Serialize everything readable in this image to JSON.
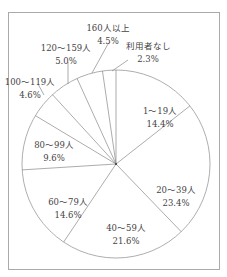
{
  "chart_data": {
    "type": "pie",
    "title": "",
    "start_angle_deg": 0,
    "direction": "clockwise",
    "slices": [
      {
        "label": "1〜19人",
        "value": 14.4,
        "pct": "14.4%"
      },
      {
        "label": "20〜39人",
        "value": 23.4,
        "pct": "23.4%"
      },
      {
        "label": "40〜59人",
        "value": 21.6,
        "pct": "21.6%"
      },
      {
        "label": "60〜79人",
        "value": 14.6,
        "pct": "14.6%"
      },
      {
        "label": "80〜99人",
        "value": 9.6,
        "pct": "9.6%"
      },
      {
        "label": "100〜119人",
        "value": 4.6,
        "pct": "4.6%"
      },
      {
        "label": "120〜159人",
        "value": 5.0,
        "pct": "5.0%"
      },
      {
        "label": "160人以上",
        "value": 4.5,
        "pct": "4.5%"
      },
      {
        "label": "利用者なし",
        "value": 2.3,
        "pct": "2.3%"
      }
    ],
    "unit": "%",
    "legend": "none"
  }
}
